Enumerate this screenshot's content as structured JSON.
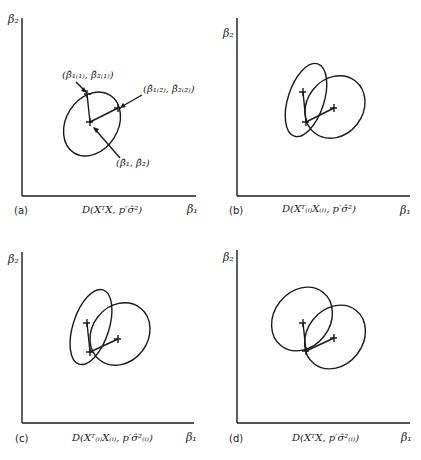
{
  "panels": [
    {
      "id": "a",
      "caption": "(a)",
      "y_axis_label": "β₂",
      "x_axis_label": "β₁",
      "formula": "D(XᵀX, p′σ̂²)",
      "point_labels": {
        "p1": "(β̂₁₍₁₎, β̂₂₍₁₎)",
        "p2": "(β̂₁₍₂₎, β̂₂₍₂₎)",
        "center": "(β̂₁, β̂₂)"
      }
    },
    {
      "id": "b",
      "caption": "(b)",
      "y_axis_label": "β₂",
      "x_axis_label": "β₁",
      "formula": "D(Xᵀ₍ᵢ₎X₍ᵢ₎, p′σ̂²)"
    },
    {
      "id": "c",
      "caption": "(c)",
      "y_axis_label": "β₂",
      "x_axis_label": "β₁",
      "formula": "D(Xᵀ₍ᵢ₎X₍ᵢ₎, p′σ̂²₍ᵢ₎)"
    },
    {
      "id": "d",
      "caption": "(d)",
      "y_axis_label": "β₂",
      "x_axis_label": "β₁",
      "formula": "D(XᵀX, p′σ̂²₍ᵢ₎)"
    }
  ],
  "colors": {
    "ink": "#1a1a1a",
    "background": "#ffffff"
  }
}
